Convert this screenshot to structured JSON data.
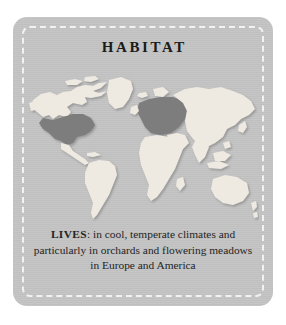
{
  "card": {
    "title": "HABITAT",
    "background_color": "#c3c3c3",
    "border_style": "white-dashed",
    "border_color": "#f2f2f2"
  },
  "caption": {
    "lead": "LIVES",
    "separator": ": ",
    "text": "in cool, temperate climates and particularly in orchards and flowering meadows in Europe and America",
    "full_text": "LIVES: in cool, temperate climates and particularly in orchards and flowering meadows in Europe and America"
  },
  "map": {
    "name": "world-map",
    "projection": "equirectangular",
    "land_color": "#eeeae2",
    "highlight_color": "#7d7d7d",
    "ocean_color": "#b9b9b9",
    "shadow_color": "#9a9a9a",
    "highlighted_regions": [
      "United States",
      "Europe",
      "Western Russia"
    ],
    "unhighlighted_regions": [
      "Canada",
      "Greenland",
      "Mexico",
      "Central America",
      "South America",
      "Africa",
      "Asia",
      "Southeast Asia",
      "Australia",
      "New Zealand",
      "Japan",
      "Iceland",
      "British Isles",
      "Madagascar"
    ]
  }
}
